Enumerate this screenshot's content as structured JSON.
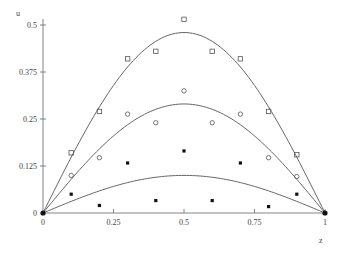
{
  "chart_data": {
    "type": "scatter",
    "title": "",
    "xlabel": "z",
    "ylabel": "u",
    "xlim": [
      0,
      1
    ],
    "ylim": [
      0,
      0.5
    ],
    "grid": false,
    "legend": null,
    "x_ticks": [
      "0",
      "0.25",
      "0.5",
      "0.75",
      "1"
    ],
    "y_ticks": [
      "0",
      "0.125",
      "0.25",
      "0.375",
      "0.5"
    ],
    "x": [
      0,
      0.1,
      0.2,
      0.3,
      0.4,
      0.5,
      0.6,
      0.7,
      0.8,
      0.9,
      1
    ],
    "curves": [
      {
        "name": "upper curve",
        "formula": "0.48*sin(pi*z)",
        "amplitude": 0.48
      },
      {
        "name": "middle curve",
        "formula": "0.29*sin(pi*z)",
        "amplitude": 0.29
      },
      {
        "name": "lower curve",
        "formula": "0.10*sin(pi*z)",
        "amplitude": 0.1
      }
    ],
    "series": [
      {
        "name": "open squares",
        "marker": "square-open",
        "values": [
          0,
          0.16,
          0.27,
          0.41,
          0.43,
          0.515,
          0.43,
          0.41,
          0.27,
          0.155,
          0
        ]
      },
      {
        "name": "open circles",
        "marker": "circle-open",
        "values": [
          0,
          0.1,
          0.147,
          0.263,
          0.24,
          0.325,
          0.24,
          0.263,
          0.147,
          0.097,
          0
        ]
      },
      {
        "name": "filled squares",
        "marker": "square-filled",
        "values": [
          0,
          0.05,
          0.02,
          0.133,
          0.033,
          0.165,
          0.033,
          0.133,
          0.017,
          0.05,
          0
        ]
      }
    ]
  },
  "layout": {
    "x0": 43,
    "x1": 325,
    "y0": 213,
    "yscale": 376,
    "axis_color": "#666666",
    "marker_color": "#555555"
  }
}
